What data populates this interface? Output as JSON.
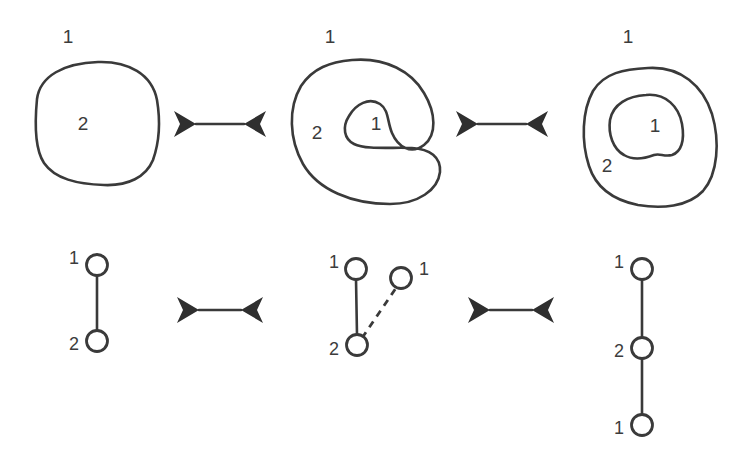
{
  "figure": {
    "stroke_color": "#3a3a3a",
    "arrow_color": "#2f2f2f",
    "background_color": "#ffffff",
    "rows": 2,
    "columns": 3
  },
  "top_row": {
    "panel1": {
      "name": "rounded-square-blob",
      "outer_label": "1",
      "inner_label": "2",
      "description": "single rounded square region labeled 2 inside outer region 1"
    },
    "panel2": {
      "name": "c-shaped-blob",
      "outer_label": "1",
      "body_label": "2",
      "notch_label": "1",
      "description": "C shaped region 2 with a notch of region 1 reaching inside"
    },
    "panel3": {
      "name": "nested-blob",
      "outer_label": "1",
      "ring_label": "2",
      "inner_label": "1",
      "description": "outer region 1 containing ring region 2 containing island region 1"
    },
    "arrow1": {
      "name": "double-arrow",
      "glyph": "double-headed-horizontal-arrow"
    },
    "arrow2": {
      "name": "double-arrow",
      "glyph": "double-headed-horizontal-arrow"
    }
  },
  "bottom_row": {
    "graph1": {
      "name": "two-node-chain",
      "nodes": [
        {
          "label": "1",
          "label_side": "left"
        },
        {
          "label": "2",
          "label_side": "left"
        }
      ],
      "edges": [
        {
          "style": "solid",
          "from": 0,
          "to": 1
        }
      ]
    },
    "graph2": {
      "name": "three-node-branch",
      "nodes": [
        {
          "label": "1",
          "label_side": "left"
        },
        {
          "label": "1",
          "label_side": "right"
        },
        {
          "label": "2",
          "label_side": "left"
        }
      ],
      "edges": [
        {
          "style": "solid",
          "from": 0,
          "to": 2
        },
        {
          "style": "dashed",
          "from": 2,
          "to": 1
        }
      ]
    },
    "graph3": {
      "name": "three-node-chain",
      "nodes": [
        {
          "label": "1",
          "label_side": "left"
        },
        {
          "label": "2",
          "label_side": "left"
        },
        {
          "label": "1",
          "label_side": "left"
        }
      ],
      "edges": [
        {
          "style": "solid",
          "from": 0,
          "to": 1
        },
        {
          "style": "solid",
          "from": 1,
          "to": 2
        }
      ]
    },
    "arrow1": {
      "name": "double-arrow",
      "glyph": "double-headed-horizontal-arrow"
    },
    "arrow2": {
      "name": "double-arrow",
      "glyph": "double-headed-horizontal-arrow"
    }
  }
}
